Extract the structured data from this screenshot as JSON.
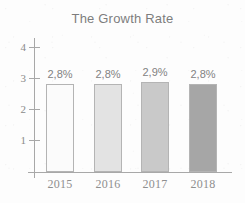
{
  "chart_data": {
    "type": "bar",
    "title": "The Growth Rate",
    "xlabel": "",
    "ylabel": "",
    "categories": [
      "2015",
      "2016",
      "2017",
      "2018"
    ],
    "values": [
      2.85,
      2.85,
      2.9,
      2.85
    ],
    "data_labels": [
      "2,8%",
      "2,8%",
      "2,9%",
      "2,8%"
    ],
    "ylim": [
      0,
      4.4
    ],
    "yticks": [
      1,
      2,
      3,
      4
    ],
    "ytick_labels": [
      "1",
      "2",
      "3",
      "4"
    ],
    "grid": false,
    "legend": false,
    "bar_colors": [
      "#fbfbfb",
      "#e3e3e3",
      "#c9c9c9",
      "#a6a6a6"
    ],
    "bar_border_color": "#b4b4b4",
    "axis_color": "#a8a8a8",
    "title_color": "#7d7d7d",
    "label_color": "#828282",
    "tick_color": "#8f8f8f",
    "background_color": "#fdfdfd"
  }
}
